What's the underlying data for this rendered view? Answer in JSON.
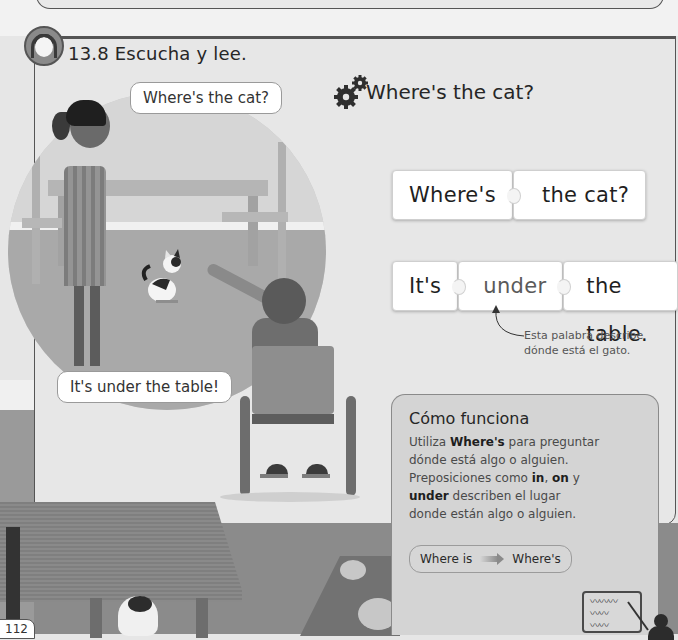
{
  "section": {
    "number": "13.8",
    "title": "13.8 Escucha y lee.",
    "audio_icon": "headphones-child-icon"
  },
  "illustration": {
    "girl_bubble": "Where's the cat?",
    "boy_bubble": "It's under the table!"
  },
  "grammar": {
    "heading": "Where's the cat?",
    "heading_icon": "gears-icon",
    "question_pieces": [
      "Where's",
      "the cat?"
    ],
    "answer_pieces": [
      "It's",
      "under",
      "the table."
    ],
    "annotation": {
      "line1": "Esta palabra describe",
      "line2": "dónde está el gato."
    }
  },
  "how_it_works": {
    "title": "Cómo funciona",
    "lines": [
      {
        "pre": "Utiliza ",
        "bold": "Where's",
        "post": " para preguntar"
      },
      {
        "pre": "dónde está algo o alguien.",
        "bold": "",
        "post": ""
      },
      {
        "pre": "Preposiciones como ",
        "bold": "in",
        "post": ", "
      },
      {
        "pre": "",
        "bold": "under",
        "post": " describen el lugar"
      },
      {
        "pre": "donde están algo o alguien.",
        "bold": "",
        "post": ""
      }
    ],
    "line3_bold2": "on",
    "line3_tail": " y",
    "contraction": {
      "from": "Where is",
      "to": "Where's"
    },
    "board_squiggles": [
      "〰〰〰",
      "〰〰",
      "〰〰"
    ]
  },
  "page": {
    "number": "112"
  },
  "colors": {
    "panel_bg": "#e7e7e7",
    "border": "#555555",
    "howto_bg": "#d4d4d4",
    "piece_bg": "#ffffff"
  }
}
